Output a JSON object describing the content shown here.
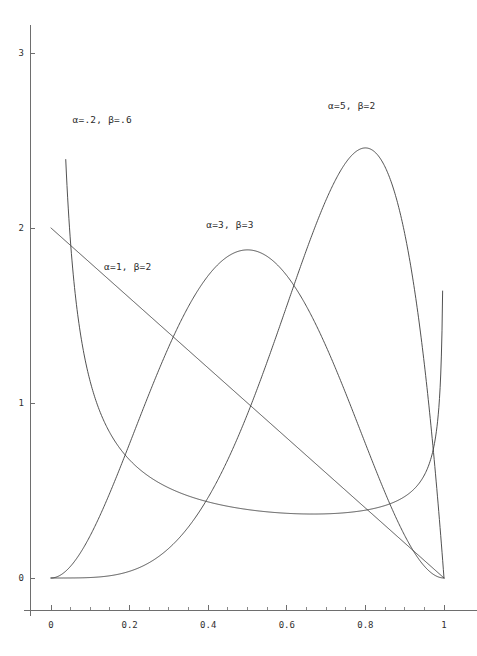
{
  "chart_data": {
    "type": "line",
    "title": "",
    "subtitle": "",
    "xlabel": "",
    "ylabel": "",
    "xlim": [
      0,
      1
    ],
    "ylim": [
      0,
      3.1
    ],
    "grid": false,
    "legend_position": "inline-annotations",
    "x_ticks": [
      {
        "value": 0,
        "label": "0"
      },
      {
        "value": 0.2,
        "label": "0.2"
      },
      {
        "value": 0.4,
        "label": "0.4"
      },
      {
        "value": 0.6,
        "label": "0.6"
      },
      {
        "value": 0.8,
        "label": "0.8"
      },
      {
        "value": 1,
        "label": "1"
      }
    ],
    "x_minor_ticks": [
      0.05,
      0.1,
      0.15,
      0.25,
      0.3,
      0.35,
      0.45,
      0.5,
      0.55,
      0.65,
      0.7,
      0.75,
      0.85,
      0.9,
      0.95
    ],
    "y_ticks": [
      {
        "value": 0,
        "label": "0"
      },
      {
        "value": 1,
        "label": "1"
      },
      {
        "value": 2,
        "label": "2"
      },
      {
        "value": 3,
        "label": "3"
      }
    ],
    "y_minor_ticks": [],
    "curve_color": "#3d3d3d",
    "axis_color": "#6e6e6e",
    "series": [
      {
        "name": "alpha=.2, beta=.6",
        "label": "α=.2, β=.6",
        "alpha": 0.2,
        "beta": 0.6,
        "label_x": 0.055,
        "label_y": 2.62,
        "x_start": 0.0375,
        "x_end": 0.9965,
        "clip_top": 3.05,
        "notes": "U-shaped Beta density, truncated at top and at right edge",
        "sample_points": [
          {
            "x": 0.0375,
            "y": 3.05
          },
          {
            "x": 0.06,
            "y": 2.29
          },
          {
            "x": 0.1,
            "y": 1.67
          },
          {
            "x": 0.2,
            "y": 1.05
          },
          {
            "x": 0.3,
            "y": 0.76
          },
          {
            "x": 0.4,
            "y": 0.58
          },
          {
            "x": 0.5,
            "y": 0.46
          },
          {
            "x": 0.6,
            "y": 0.39
          },
          {
            "x": 0.7,
            "y": 0.35
          },
          {
            "x": 0.8,
            "y": 0.35
          },
          {
            "x": 0.9,
            "y": 0.45
          },
          {
            "x": 0.96,
            "y": 0.68
          },
          {
            "x": 0.9965,
            "y": 1.33
          }
        ]
      },
      {
        "name": "alpha=1, beta=2",
        "label": "α=1, β=2",
        "alpha": 1,
        "beta": 2,
        "label_x": 0.135,
        "label_y": 1.78,
        "x_start": 0,
        "x_end": 1,
        "notes": "Straight descending line 2(1-x)",
        "sample_points": [
          {
            "x": 0,
            "y": 2.0
          },
          {
            "x": 0.25,
            "y": 1.5
          },
          {
            "x": 0.5,
            "y": 1.0
          },
          {
            "x": 0.75,
            "y": 0.5
          },
          {
            "x": 1,
            "y": 0.0
          }
        ]
      },
      {
        "name": "alpha=3, beta=3",
        "label": "α=3, β=3",
        "alpha": 3,
        "beta": 3,
        "label_x": 0.395,
        "label_y": 2.02,
        "x_start": 0,
        "x_end": 1,
        "peak_x": 0.5,
        "peak_y": 1.875,
        "sample_points": [
          {
            "x": 0,
            "y": 0
          },
          {
            "x": 0.1,
            "y": 0.243
          },
          {
            "x": 0.2,
            "y": 0.768
          },
          {
            "x": 0.3,
            "y": 1.323
          },
          {
            "x": 0.4,
            "y": 1.728
          },
          {
            "x": 0.5,
            "y": 1.875
          },
          {
            "x": 0.6,
            "y": 1.728
          },
          {
            "x": 0.7,
            "y": 1.323
          },
          {
            "x": 0.8,
            "y": 0.768
          },
          {
            "x": 0.9,
            "y": 0.243
          },
          {
            "x": 1,
            "y": 0
          }
        ]
      },
      {
        "name": "alpha=5, beta=2",
        "label": "α=5, β=2",
        "alpha": 5,
        "beta": 2,
        "label_x": 0.705,
        "label_y": 2.7,
        "x_start": 0,
        "x_end": 1,
        "peak_x": 0.8,
        "peak_y": 2.4576,
        "sample_points": [
          {
            "x": 0,
            "y": 0
          },
          {
            "x": 0.2,
            "y": 0.0384
          },
          {
            "x": 0.4,
            "y": 0.3686
          },
          {
            "x": 0.5,
            "y": 0.9375
          },
          {
            "x": 0.6,
            "y": 1.5552
          },
          {
            "x": 0.7,
            "y": 2.1609
          },
          {
            "x": 0.8,
            "y": 2.4576
          },
          {
            "x": 0.9,
            "y": 1.9683
          },
          {
            "x": 0.95,
            "y": 1.2218
          },
          {
            "x": 1,
            "y": 0
          }
        ]
      }
    ]
  }
}
